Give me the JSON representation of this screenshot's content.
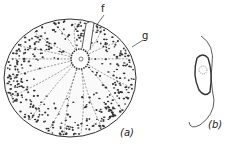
{
  "figure": {
    "panels": [
      {
        "id": "a",
        "label": "(a)",
        "description": "spherical cell with central nucleus, radiating strands and dense granules"
      },
      {
        "id": "b",
        "label": "(b)",
        "description": "small oval cell with long flagellum"
      }
    ],
    "annotations": [
      {
        "id": "f",
        "text": "f"
      },
      {
        "id": "g",
        "text": "g"
      }
    ],
    "colors": {
      "ink": "#2a2a2a",
      "background": "#ffffff"
    }
  }
}
